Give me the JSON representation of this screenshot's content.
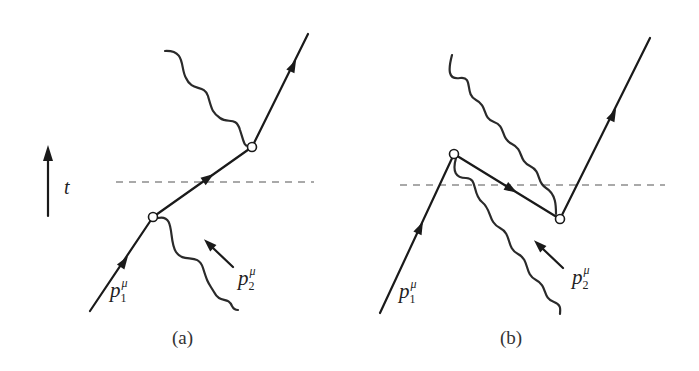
{
  "figure": {
    "time_axis": {
      "label": "t"
    },
    "panels": [
      {
        "id": "a",
        "caption": "(a)",
        "incoming_fermion_label": {
          "symbol": "p",
          "subscript": "1",
          "superscript": "μ"
        },
        "incoming_photon_label": {
          "symbol": "p",
          "subscript": "2",
          "superscript": "μ"
        }
      },
      {
        "id": "b",
        "caption": "(b)",
        "incoming_fermion_label": {
          "symbol": "p",
          "subscript": "1",
          "superscript": "μ"
        },
        "incoming_photon_label": {
          "symbol": "p",
          "subscript": "2",
          "superscript": "μ"
        }
      }
    ],
    "colors": {
      "ink": "#1a1a1a",
      "dash": "#555555",
      "background": "#ffffff"
    }
  }
}
